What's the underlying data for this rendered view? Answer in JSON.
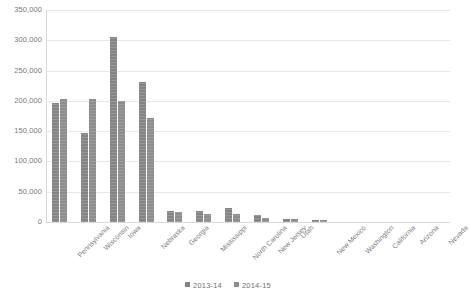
{
  "chart_data": {
    "type": "bar",
    "title": "",
    "subtitle": "",
    "xlabel": "",
    "ylabel": "",
    "ylim": [
      0,
      350000
    ],
    "ytick_labels": [
      "350,000",
      "300,000",
      "250,000",
      "200,000",
      "150,000",
      "100,000",
      "50,000",
      "0"
    ],
    "ytick_values": [
      350000,
      300000,
      250000,
      200000,
      150000,
      100000,
      50000,
      0
    ],
    "grid": true,
    "legend_position": "bottom",
    "categories": [
      "Pennsylvania",
      "Wisconsin",
      "Iowa",
      "Nebraska",
      "Georgia",
      "Mississippi",
      "North Carolina",
      "New Jersey",
      "Utah",
      "New Mexico",
      "Washington",
      "California",
      "Arizona",
      "Nevada"
    ],
    "series": [
      {
        "name": "2013-14",
        "color": "#848484",
        "values": [
          197000,
          147000,
          306000,
          231000,
          19000,
          18000,
          23000,
          11000,
          5000,
          3000,
          0,
          0,
          0,
          0
        ]
      },
      {
        "name": "2014-15",
        "color": "#8d8d8d",
        "values": [
          203000,
          203000,
          200000,
          172000,
          17000,
          14000,
          13000,
          7000,
          5000,
          3000,
          0,
          0,
          0,
          0
        ]
      }
    ]
  }
}
